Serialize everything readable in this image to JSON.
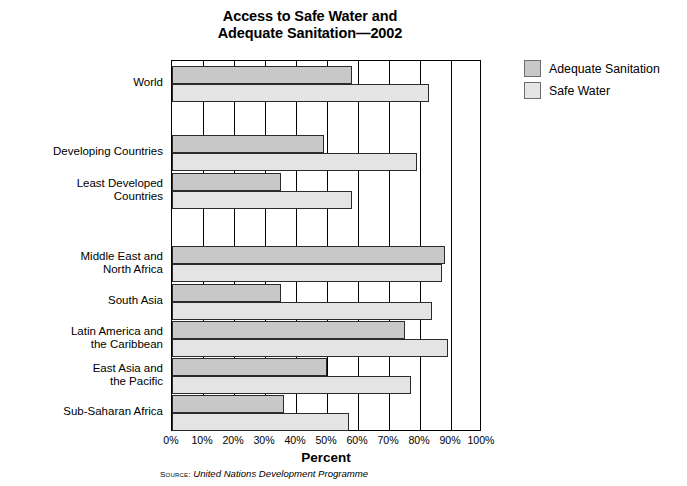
{
  "chart_data": {
    "type": "bar",
    "orientation": "horizontal",
    "title": "Access to Safe Water and Adequate Sanitation—2002",
    "title_lines": [
      "Access to Safe Water and",
      "Adequate Sanitation—2002"
    ],
    "xlabel": "Percent",
    "ylabel": "",
    "xlim": [
      0,
      100
    ],
    "xticks": [
      0,
      10,
      20,
      30,
      40,
      50,
      60,
      70,
      80,
      90,
      100
    ],
    "xticklabels": [
      "0%",
      "10%",
      "20%",
      "30%",
      "40%",
      "50%",
      "60%",
      "70%",
      "80%",
      "90%",
      "100%"
    ],
    "grid": true,
    "grid_axis": "x",
    "legend_position": "right",
    "categories": [
      "World",
      "Developing Countries",
      "Least Developed Countries",
      "Middle East and North Africa",
      "South Asia",
      "Latin America and the Caribbean",
      "East Asia and the Pacific",
      "Sub-Saharan Africa"
    ],
    "category_label_lines": [
      [
        "World"
      ],
      [
        "Developing Countries"
      ],
      [
        "Least Developed",
        "Countries"
      ],
      [
        "Middle East and",
        "North Africa"
      ],
      [
        "South Asia"
      ],
      [
        "Latin America and",
        "the Caribbean"
      ],
      [
        "East Asia and",
        "the Pacific"
      ],
      [
        "Sub-Saharan Africa"
      ]
    ],
    "series": [
      {
        "name": "Adequate Sanitation",
        "color": "#c8c8c8",
        "values": [
          58,
          49,
          35,
          88,
          35,
          75,
          50,
          36
        ]
      },
      {
        "name": "Safe Water",
        "color": "#e4e4e4",
        "values": [
          83,
          79,
          58,
          87,
          84,
          89,
          77,
          57
        ]
      }
    ],
    "source_label": "Source:",
    "source_text": "United Nations Development Programme"
  },
  "legend": {
    "items": [
      {
        "label": "Adequate Sanitation",
        "swatch": "sanitation"
      },
      {
        "label": "Safe Water",
        "swatch": "water"
      }
    ]
  }
}
